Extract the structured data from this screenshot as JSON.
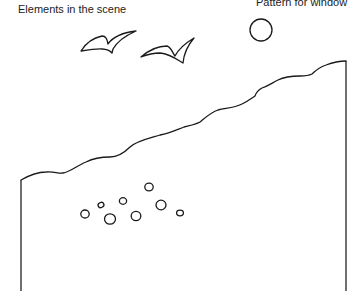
{
  "headings": {
    "left": "Elements in the scene",
    "right": "Pattern for window"
  },
  "scene": {
    "elements": [
      {
        "name": "bird",
        "count": 2
      },
      {
        "name": "sun",
        "count": 1
      },
      {
        "name": "hill-slope",
        "count": 1
      },
      {
        "name": "pebble",
        "count": 9
      }
    ],
    "colors": {
      "background": "#ffffff",
      "ink": "#1a1a1a"
    }
  }
}
